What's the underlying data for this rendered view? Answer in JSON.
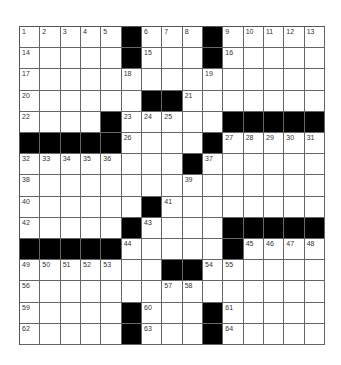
{
  "puzzle": {
    "rows": 15,
    "cols": 15,
    "colors": {
      "black": "#000000",
      "white": "#ffffff",
      "line": "#666666",
      "number": "#333333"
    },
    "grid": [
      [
        "1",
        "2",
        "3",
        "4",
        "5",
        "#",
        "6",
        "7",
        "8",
        "#",
        "9",
        "10",
        "11",
        "12",
        "13"
      ],
      [
        "14",
        "",
        "",
        "",
        "",
        "#",
        "15",
        "",
        "",
        "#",
        "16",
        "",
        "",
        "",
        ""
      ],
      [
        "17",
        "",
        "",
        "",
        "",
        "18",
        "",
        "",
        "",
        "19",
        "",
        "",
        "",
        "",
        ""
      ],
      [
        "20",
        "",
        "",
        "",
        "",
        "",
        "#",
        "#",
        "21",
        "",
        "",
        "",
        "",
        "",
        ""
      ],
      [
        "22",
        "",
        "",
        "",
        "#",
        "23",
        "24",
        "25",
        "",
        "",
        "#",
        "#",
        "#",
        "#",
        "#"
      ],
      [
        "#",
        "#",
        "#",
        "#",
        "#",
        "26",
        "",
        "",
        "",
        "#",
        "27",
        "28",
        "29",
        "30",
        "31"
      ],
      [
        "32",
        "33",
        "34",
        "35",
        "36",
        "",
        "",
        "",
        "#",
        "37",
        "",
        "",
        "",
        "",
        ""
      ],
      [
        "38",
        "",
        "",
        "",
        "",
        "",
        "",
        "",
        "39",
        "",
        "",
        "",
        "",
        "",
        ""
      ],
      [
        "40",
        "",
        "",
        "",
        "",
        "",
        "#",
        "41",
        "",
        "",
        "",
        "",
        "",
        "",
        ""
      ],
      [
        "42",
        "",
        "",
        "",
        "",
        "#",
        "43",
        "",
        "",
        "",
        "#",
        "#",
        "#",
        "#",
        "#"
      ],
      [
        "#",
        "#",
        "#",
        "#",
        "#",
        "44",
        "",
        "",
        "",
        "",
        "#",
        "45",
        "46",
        "47",
        "48"
      ],
      [
        "49",
        "50",
        "51",
        "52",
        "53",
        "",
        "",
        "#",
        "#",
        "54",
        "55",
        "",
        "",
        "",
        ""
      ],
      [
        "56",
        "",
        "",
        "",
        "",
        "",
        "",
        "57",
        "58",
        "",
        "",
        "",
        "",
        "",
        ""
      ],
      [
        "59",
        "",
        "",
        "",
        "",
        "#",
        "60",
        "",
        "",
        "#",
        "61",
        "",
        "",
        "",
        ""
      ],
      [
        "62",
        "",
        "",
        "",
        "",
        "#",
        "63",
        "",
        "",
        "#",
        "64",
        "",
        "",
        "",
        ""
      ]
    ]
  }
}
